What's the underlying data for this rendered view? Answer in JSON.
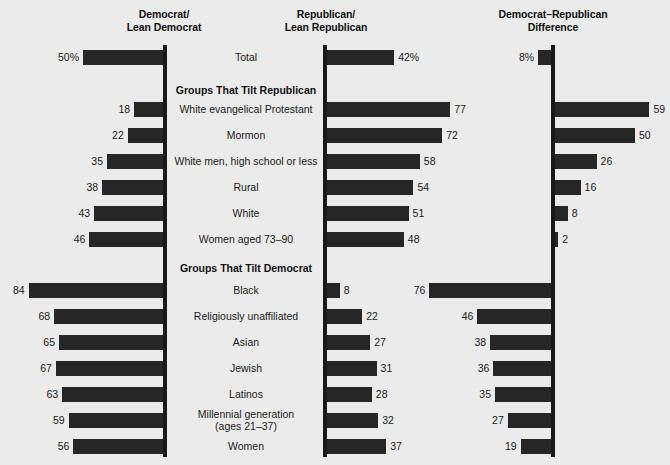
{
  "headers": {
    "democrat": "Democrat/\nLean Democrat",
    "democrat_l1": "Democrat/",
    "democrat_l2": "Lean Democrat",
    "republican_l1": "Republican/",
    "republican_l2": "Lean Republican",
    "difference_l1": "Democrat–Republican",
    "difference_l2": "Difference"
  },
  "sections": {
    "tilt_republican": "Groups That Tilt Republican",
    "tilt_democrat": "Groups That Tilt Democrat"
  },
  "chart_data": {
    "type": "bar",
    "subtype": "diverging-paired-bars",
    "columns": [
      {
        "key": "democrat",
        "label": "Democrat/Lean Democrat",
        "direction": "left",
        "axis_x": 163
      },
      {
        "key": "republican",
        "label": "Republican/Lean Republican",
        "direction": "right",
        "axis_x": 323
      },
      {
        "key": "difference",
        "label": "Democrat–Republican Difference",
        "direction": "signed",
        "axis_x": 551
      }
    ],
    "units": "percent",
    "px_per_unit": 1.6,
    "xlabel": "",
    "ylabel": "",
    "grid": false,
    "legend": "none",
    "rows": [
      {
        "label": "Total",
        "label_lines": [
          "Total"
        ],
        "group": "total",
        "democrat": 50,
        "democrat_display": "50%",
        "republican": 42,
        "republican_display": "42%",
        "difference": 8,
        "difference_display": "8%",
        "difference_favors": "democrat",
        "y": 50
      },
      {
        "label": "White evangelical Protestant",
        "label_lines": [
          "White evangelical Protestant"
        ],
        "group": "tilt_republican",
        "democrat": 18,
        "democrat_display": "18",
        "republican": 77,
        "republican_display": "77",
        "difference": 59,
        "difference_display": "59",
        "difference_favors": "republican",
        "y": 102
      },
      {
        "label": "Mormon",
        "label_lines": [
          "Mormon"
        ],
        "group": "tilt_republican",
        "democrat": 22,
        "democrat_display": "22",
        "republican": 72,
        "republican_display": "72",
        "difference": 50,
        "difference_display": "50",
        "difference_favors": "republican",
        "y": 128
      },
      {
        "label": "White men, high school or less",
        "label_lines": [
          "White men, high school or less"
        ],
        "group": "tilt_republican",
        "democrat": 35,
        "democrat_display": "35",
        "republican": 58,
        "republican_display": "58",
        "difference": 26,
        "difference_display": "26",
        "difference_favors": "republican",
        "y": 154
      },
      {
        "label": "Rural",
        "label_lines": [
          "Rural"
        ],
        "group": "tilt_republican",
        "democrat": 38,
        "democrat_display": "38",
        "republican": 54,
        "republican_display": "54",
        "difference": 16,
        "difference_display": "16",
        "difference_favors": "republican",
        "y": 180
      },
      {
        "label": "White",
        "label_lines": [
          "White"
        ],
        "group": "tilt_republican",
        "democrat": 43,
        "democrat_display": "43",
        "republican": 51,
        "republican_display": "51",
        "difference": 8,
        "difference_display": "8",
        "difference_favors": "republican",
        "y": 206
      },
      {
        "label": "Women aged 73–90",
        "label_lines": [
          "Women aged 73–90"
        ],
        "group": "tilt_republican",
        "democrat": 46,
        "democrat_display": "46",
        "republican": 48,
        "republican_display": "48",
        "difference": 2,
        "difference_display": "2",
        "difference_favors": "republican",
        "y": 232
      },
      {
        "label": "Black",
        "label_lines": [
          "Black"
        ],
        "group": "tilt_democrat",
        "democrat": 84,
        "democrat_display": "84",
        "republican": 8,
        "republican_display": "8",
        "difference": 76,
        "difference_display": "76",
        "difference_favors": "democrat",
        "y": 283
      },
      {
        "label": "Religiously unaffiliated",
        "label_lines": [
          "Religiously unaffiliated"
        ],
        "group": "tilt_democrat",
        "democrat": 68,
        "democrat_display": "68",
        "republican": 22,
        "republican_display": "22",
        "difference": 46,
        "difference_display": "46",
        "difference_favors": "democrat",
        "y": 309
      },
      {
        "label": "Asian",
        "label_lines": [
          "Asian"
        ],
        "group": "tilt_democrat",
        "democrat": 65,
        "democrat_display": "65",
        "republican": 27,
        "republican_display": "27",
        "difference": 38,
        "difference_display": "38",
        "difference_favors": "democrat",
        "y": 335
      },
      {
        "label": "Jewish",
        "label_lines": [
          "Jewish"
        ],
        "group": "tilt_democrat",
        "democrat": 67,
        "democrat_display": "67",
        "republican": 31,
        "republican_display": "31",
        "difference": 36,
        "difference_display": "36",
        "difference_favors": "democrat",
        "y": 361
      },
      {
        "label": "Latinos",
        "label_lines": [
          "Latinos"
        ],
        "group": "tilt_democrat",
        "democrat": 63,
        "democrat_display": "63",
        "republican": 28,
        "republican_display": "28",
        "difference": 35,
        "difference_display": "35",
        "difference_favors": "democrat",
        "y": 387
      },
      {
        "label": "Millennial generation (ages 21–37)",
        "label_lines": [
          "Millennial generation",
          "(ages 21–37)"
        ],
        "group": "tilt_democrat",
        "democrat": 59,
        "democrat_display": "59",
        "republican": 32,
        "republican_display": "32",
        "difference": 27,
        "difference_display": "27",
        "difference_favors": "democrat",
        "y": 413
      },
      {
        "label": "Women",
        "label_lines": [
          "Women"
        ],
        "group": "tilt_democrat",
        "democrat": 56,
        "democrat_display": "56",
        "republican": 37,
        "republican_display": "37",
        "difference": 19,
        "difference_display": "19",
        "difference_favors": "democrat",
        "y": 439
      }
    ],
    "section_headers": [
      {
        "text": "Groups That Tilt Republican",
        "y": 84
      },
      {
        "text": "Groups That Tilt Democrat",
        "y": 262
      }
    ]
  },
  "colors": {
    "bar": "#262626",
    "axis": "#191919",
    "background": "#ebebeb",
    "text": "#1b1b1b"
  }
}
